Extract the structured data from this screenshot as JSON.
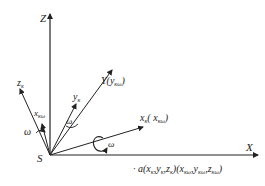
{
  "diagram": {
    "origin_label": "S",
    "axes": {
      "z": "Z",
      "x": "X"
    },
    "vectors": {
      "z_k": {
        "main": "z",
        "sub": "κ"
      },
      "x_kw": {
        "main": "x",
        "sub": "κω"
      },
      "y_k": {
        "main": "y",
        "sub": "κ"
      },
      "Y": {
        "main": "Y(",
        "inner_main": "y",
        "inner_sub": "κω",
        "close": ")"
      },
      "x_k": {
        "main": "x",
        "sub": "κ",
        "open": "( ",
        "inner_main": "x",
        "inner_sub": "κω",
        "close": ")"
      }
    },
    "omega_labels": [
      "ω",
      "ω",
      "ω"
    ],
    "point_label": "· a(x",
    "point_label_parts": {
      "prefix": "· a(",
      "xk": "x",
      "xk_sub": "κ",
      "yk": "y",
      "yk_sub": "κ",
      "zk": "z",
      "zk_sub": "κ",
      "mid": ")(",
      "xkw": "x",
      "xkw_sub": "κω",
      "ykw": "y",
      "ykw_sub": "κω",
      "zkw": "z",
      "zkw_sub": "κω",
      "suffix": ")",
      "comma": ","
    },
    "colors": {
      "line": "#222222",
      "background": "#ffffff"
    }
  }
}
